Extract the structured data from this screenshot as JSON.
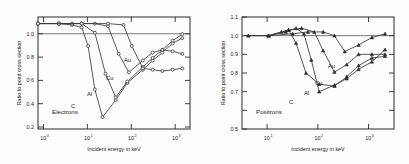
{
  "figure": {
    "title": "",
    "panels": [
      "electrons",
      "positrons"
    ]
  },
  "left": {
    "panel_label": "Electrons",
    "xlabel": "Incident energy in keV",
    "ylabel": "Ratio to point cross section",
    "xticklabels": [
      "10",
      "10",
      "10",
      "10"
    ],
    "xtickexponents": [
      "0",
      "1",
      "2",
      "3"
    ],
    "yticklabels": [
      "1.0",
      "0.8",
      "0.6",
      "0.4",
      "0.2"
    ],
    "series_labels": {
      "c": "C",
      "al": "Al",
      "cu": "Cu",
      "au": "Au"
    }
  },
  "right": {
    "panel_label": "Positrons",
    "xlabel": "Incident energy in keV",
    "ylabel": "Ratio to point cross section",
    "xticklabels": [
      "10",
      "10",
      "10"
    ],
    "xtickexponents": [
      "1",
      "2",
      "3"
    ],
    "yticklabels": [
      "1.1",
      "1.0",
      "0.9",
      "0.8",
      "0.7",
      "0.6",
      "0.5"
    ],
    "series_labels": {
      "c": "C",
      "al": "Al",
      "cu": "Cu",
      "au": "Au"
    }
  },
  "chart_data": [
    {
      "type": "line",
      "id": "electrons",
      "title": "Electrons",
      "xlabel": "Incident energy in keV",
      "ylabel": "Ratio to point cross section",
      "xscale": "log",
      "xlim": [
        1,
        3000
      ],
      "ylim": [
        0.2,
        1.05
      ],
      "xticks": [
        1,
        10,
        100,
        1000
      ],
      "yticks": [
        0.2,
        0.4,
        0.6,
        0.8,
        1.0
      ],
      "grid": false,
      "legend": "inline-labels",
      "marker": "open-circle",
      "reference_line_y": 1.0,
      "series": [
        {
          "name": "C",
          "x": [
            1,
            3,
            6,
            10,
            14,
            20,
            30,
            60,
            110,
            250,
            420,
            700,
            1200,
            2000
          ],
          "y": [
            1.0,
            1.0,
            0.99,
            0.97,
            0.83,
            0.5,
            0.29,
            0.42,
            0.55,
            0.65,
            0.72,
            0.78,
            0.85,
            0.89
          ]
        },
        {
          "name": "Al",
          "x": [
            1,
            3,
            6,
            10,
            20,
            35,
            60,
            110,
            250,
            420,
            700,
            1200,
            2000
          ],
          "y": [
            1.0,
            1.0,
            1.0,
            1.0,
            0.93,
            0.62,
            0.44,
            0.56,
            0.67,
            0.74,
            0.8,
            0.87,
            0.92
          ]
        },
        {
          "name": "Cu",
          "x": [
            1,
            3,
            10,
            20,
            40,
            70,
            120,
            250,
            420,
            700,
            1200,
            2000
          ],
          "y": [
            1.0,
            1.0,
            1.0,
            1.0,
            0.98,
            0.77,
            0.63,
            0.72,
            0.78,
            0.8,
            0.79,
            0.77
          ]
        },
        {
          "name": "Au",
          "x": [
            1,
            10,
            40,
            90,
            140,
            250,
            420,
            700,
            1200,
            2000
          ],
          "y": [
            1.0,
            1.0,
            1.0,
            0.99,
            0.83,
            0.66,
            0.65,
            0.64,
            0.65,
            0.66
          ]
        }
      ]
    },
    {
      "type": "line",
      "id": "positrons",
      "title": "Positrons",
      "xlabel": "Incident energy in keV",
      "ylabel": "Ratio to point cross section",
      "xscale": "log",
      "xlim": [
        3,
        3000
      ],
      "ylim": [
        0.5,
        1.1
      ],
      "xticks": [
        10,
        100,
        1000
      ],
      "yticks": [
        0.5,
        0.6,
        0.7,
        0.8,
        0.9,
        1.0,
        1.1
      ],
      "grid": false,
      "legend": "inline-labels",
      "marker": "filled-triangle",
      "reference_line_y": 1.0,
      "series": [
        {
          "name": "C",
          "x": [
            4,
            10,
            18,
            25,
            35,
            55,
            100,
            200,
            350,
            600,
            1100,
            2000
          ],
          "y": [
            1.0,
            1.0,
            1.02,
            1.03,
            0.96,
            0.8,
            0.74,
            0.73,
            0.78,
            0.84,
            0.88,
            0.89
          ]
        },
        {
          "name": "Al",
          "x": [
            4,
            10,
            22,
            35,
            50,
            70,
            100,
            200,
            350,
            600,
            1100,
            2000
          ],
          "y": [
            1.0,
            1.0,
            1.02,
            1.04,
            1.01,
            0.87,
            0.7,
            0.735,
            0.77,
            0.82,
            0.86,
            0.925
          ]
        },
        {
          "name": "Cu",
          "x": [
            10,
            25,
            45,
            80,
            120,
            200,
            350,
            600,
            1100,
            2000
          ],
          "y": [
            1.0,
            1.03,
            1.04,
            1.02,
            0.92,
            0.805,
            0.845,
            0.9,
            0.9,
            0.9
          ]
        },
        {
          "name": "Au",
          "x": [
            10,
            30,
            60,
            120,
            200,
            320,
            600,
            1100,
            2000
          ],
          "y": [
            1.0,
            1.01,
            1.02,
            1.02,
            1.0,
            0.915,
            0.95,
            0.99,
            1.01
          ]
        }
      ]
    }
  ]
}
